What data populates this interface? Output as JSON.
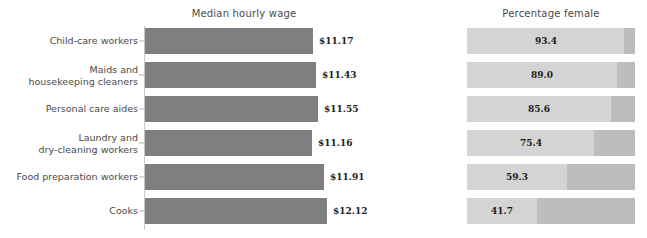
{
  "chart_data": {
    "type": "bar",
    "title": "",
    "orientation": "horizontal",
    "grid": false,
    "legend": "none",
    "categories": [
      "Child-care workers",
      "Maids and\nhousekeeping cleaners",
      "Personal care aides",
      "Laundry and\ndry-cleaning workers",
      "Food preparation workers",
      "Cooks"
    ],
    "panels": [
      {
        "key": "wage",
        "title": "Median hourly wage",
        "xlabel": "",
        "ylabel": "",
        "xlim": [
          0,
          13.0
        ],
        "bar_color": "#7f7f7f",
        "value_prefix": "$",
        "values": [
          11.17,
          11.43,
          11.55,
          11.16,
          11.91,
          12.12
        ],
        "value_labels": [
          "$11.17",
          "$11.43",
          "$11.55",
          "$11.16",
          "$11.91",
          "$12.12"
        ]
      },
      {
        "key": "percentage_female",
        "title": "Percentage female",
        "xlabel": "",
        "ylabel": "",
        "xlim": [
          0,
          100
        ],
        "fill_color": "#d4d4d4",
        "track_color": "#bdbdbd",
        "values": [
          93.4,
          89.0,
          85.6,
          75.4,
          59.3,
          41.7
        ],
        "value_labels": [
          "93.4",
          "89.0",
          "85.6",
          "75.4",
          "59.3",
          "41.7"
        ]
      }
    ]
  },
  "colors": {
    "wage_bar": "#7f7f7f",
    "pct_fill": "#d4d4d4",
    "pct_track": "#bdbdbd",
    "axis": "#c8c8c8",
    "text": "#4a4a4a",
    "value_text": "#1c1c1c",
    "background": "#ffffff"
  }
}
